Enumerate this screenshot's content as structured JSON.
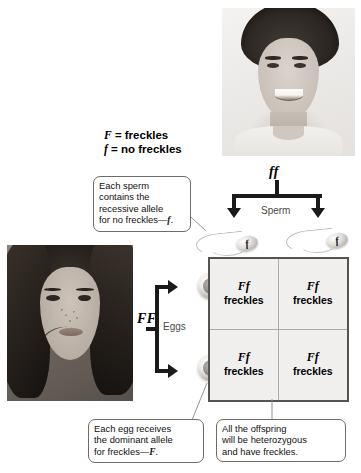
{
  "legend": {
    "dominant_symbol": "F",
    "dominant_text": "= freckles",
    "recessive_symbol": "f",
    "recessive_text": "= no freckles"
  },
  "parents": {
    "father": {
      "genotype": "ff",
      "photo_name": "father-photo",
      "photo_alt": "Smiling young man without freckles"
    },
    "mother": {
      "genotype": "FF",
      "photo_name": "mother-photo",
      "photo_alt": "Young woman with freckles"
    }
  },
  "gametes": {
    "sperm_label": "Sperm",
    "eggs_label": "Eggs",
    "sperm_alleles": [
      "f",
      "f"
    ],
    "egg_alleles": [
      "F",
      "F"
    ]
  },
  "punnett": {
    "cells": [
      {
        "genotype": "Ff",
        "phenotype": "freckles"
      },
      {
        "genotype": "Ff",
        "phenotype": "freckles"
      },
      {
        "genotype": "Ff",
        "phenotype": "freckles"
      },
      {
        "genotype": "Ff",
        "phenotype": "freckles"
      }
    ]
  },
  "callouts": {
    "sperm": {
      "line1": "Each sperm",
      "line2": "contains the",
      "line3": "recessive allele",
      "line4_prefix": "for no freckles—",
      "line4_allele": "f",
      "line4_suffix": "."
    },
    "egg": {
      "line1": "Each egg receives",
      "line2": "the dominant allele",
      "line3_prefix": "for freckles—",
      "line3_allele": "F",
      "line3_suffix": "."
    },
    "offspring": {
      "line1": "All the offspring",
      "line2": "will be heterozygous",
      "line3": "and have freckles."
    }
  },
  "colors": {
    "ink": "#000000",
    "arrow": "#1a1a1a",
    "grid_fill": "#f0efee",
    "grid_border": "#555250",
    "grid_divider": "#adaaa7",
    "callout_border": "#6e6b68",
    "label_gray": "#4a4a4a"
  }
}
